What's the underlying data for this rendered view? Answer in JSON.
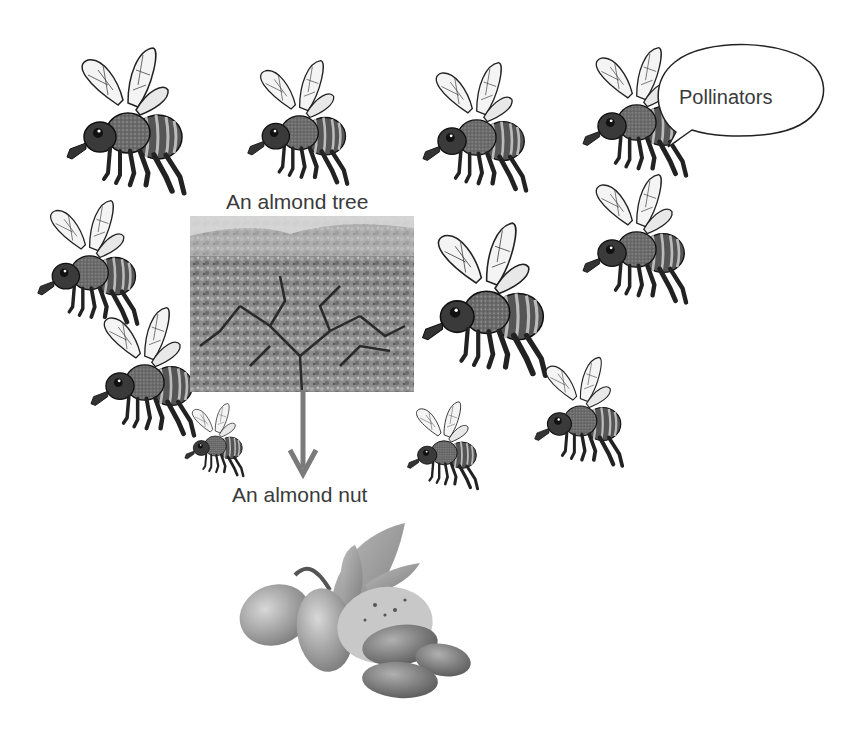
{
  "diagram": {
    "tree_label": "An almond tree",
    "nut_label": "An almond nut",
    "speech_bubble": "Pollinators",
    "arrow": {
      "from": "almond-tree",
      "to": "almond-nut",
      "color": "#7a7a7a"
    },
    "bees": [
      {
        "x": 58,
        "y": 45,
        "scale": 1.0
      },
      {
        "x": 240,
        "y": 58,
        "scale": 0.85
      },
      {
        "x": 415,
        "y": 60,
        "scale": 0.88
      },
      {
        "x": 575,
        "y": 45,
        "scale": 0.88
      },
      {
        "x": 30,
        "y": 198,
        "scale": 0.85
      },
      {
        "x": 575,
        "y": 175,
        "scale": 0.88
      },
      {
        "x": 415,
        "y": 220,
        "scale": 1.05
      },
      {
        "x": 85,
        "y": 305,
        "scale": 0.88
      },
      {
        "x": 530,
        "y": 355,
        "scale": 0.75
      },
      {
        "x": 180,
        "y": 405,
        "scale": 0.5
      },
      {
        "x": 403,
        "y": 405,
        "scale": 0.6
      }
    ],
    "colors": {
      "text": "#3a3a3a",
      "background": "#ffffff"
    }
  }
}
